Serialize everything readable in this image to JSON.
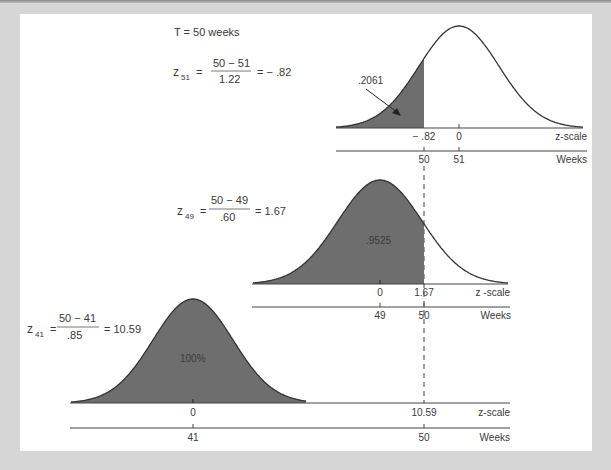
{
  "figure": {
    "header": "T = 50 weeks",
    "colors": {
      "shade": "#6e6e6e",
      "curve": "#333333",
      "axis": "#444444",
      "background": "#ffffff",
      "frame": "#d6d6d6"
    }
  },
  "panels": [
    {
      "id": "z51",
      "formula": {
        "lhs_var": "z",
        "lhs_sub": "51",
        "numerator": "50 − 51",
        "denominator": "1.22",
        "result": "= − .82"
      },
      "area_label": ".2061",
      "z_ticks": [
        "− .82",
        "0"
      ],
      "week_ticks": [
        "50",
        "51"
      ],
      "z_axis_label": "z-scale",
      "week_axis_label": "Weeks"
    },
    {
      "id": "z49",
      "formula": {
        "lhs_var": "z",
        "lhs_sub": "49",
        "numerator": "50 − 49",
        "denominator": ".60",
        "result": "= 1.67"
      },
      "area_label": ".9525",
      "z_ticks": [
        "0",
        "1.67"
      ],
      "week_ticks": [
        "49",
        "50"
      ],
      "z_axis_label": "z -scale",
      "week_axis_label": "Weeks"
    },
    {
      "id": "z41",
      "formula": {
        "lhs_var": "z",
        "lhs_sub": "41",
        "numerator": "50 − 41",
        "denominator": ".85",
        "result": "= 10.59"
      },
      "area_label": "100%",
      "z_ticks": [
        "0",
        "10.59"
      ],
      "week_ticks": [
        "41",
        "50"
      ],
      "z_axis_label": "z-scale",
      "week_axis_label": "Weeks"
    }
  ],
  "chart_data": {
    "type": "area",
    "series": [
      {
        "name": "Path ending at 51 weeks",
        "mean_weeks": 51,
        "sd": 1.22,
        "z": -0.82,
        "probability": 0.2061
      },
      {
        "name": "Path ending at 49 weeks",
        "mean_weeks": 49,
        "sd": 0.6,
        "z": 1.67,
        "probability": 0.9525
      },
      {
        "name": "Path ending at 41 weeks",
        "mean_weeks": 41,
        "sd": 0.85,
        "z": 10.59,
        "probability": 1.0
      }
    ],
    "xlabel": "z-scale / Weeks",
    "grid": false
  }
}
